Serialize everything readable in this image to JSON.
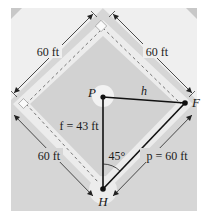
{
  "figure": {
    "colors": {
      "background": "#ffffff",
      "field": "#d6d6d6",
      "outfield": "#efefef",
      "basepath": "#ececec",
      "infield": "#d2d2d2",
      "line": "#111111"
    },
    "dimensions": {
      "top_left_side": "60 ft",
      "top_right_side": "60 ft",
      "bottom_left_side": "60 ft"
    },
    "points": {
      "pitcher": "P",
      "first_base": "F",
      "home": "H"
    },
    "segments": {
      "h": "h",
      "f": "f = 43 ft",
      "p": "p = 60 ft"
    },
    "angle": "45°"
  }
}
